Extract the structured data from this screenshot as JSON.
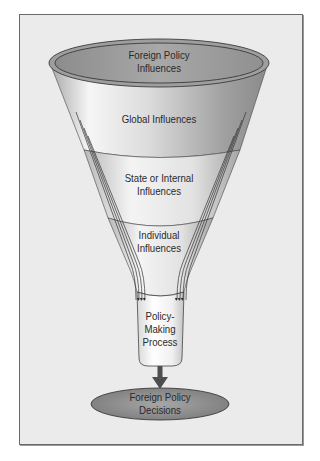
{
  "diagram": {
    "type": "funnel",
    "stages": [
      {
        "id": "rim",
        "label_line1": "Foreign Policy",
        "label_line2": "Influences"
      },
      {
        "id": "global",
        "label_line1": "Global Influences"
      },
      {
        "id": "state",
        "label_line1": "State or Internal",
        "label_line2": "Influences"
      },
      {
        "id": "individual",
        "label_line1": "Individual",
        "label_line2": "Influences"
      },
      {
        "id": "process",
        "label_line1": "Policy-",
        "label_line2": "Making",
        "label_line3": "Process"
      }
    ],
    "output": {
      "label_line1": "Foreign Policy",
      "label_line2": "Decisions"
    },
    "colors": {
      "frame_bg": "#ebebeb",
      "frame_border": "#6a6a6a",
      "rim_fill": "#9a9a9a",
      "cone_light": "#f4f4f4",
      "cone_dark": "#8c8c8c",
      "outline": "#333333",
      "arrow": "#4d4d4d",
      "decision_fill": "#8f8f8f"
    }
  }
}
